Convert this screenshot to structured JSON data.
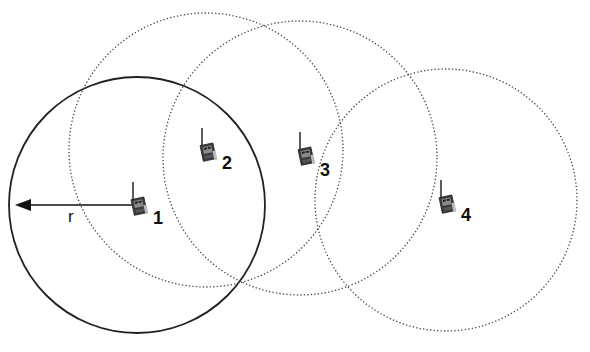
{
  "diagram": {
    "type": "wireless-network-range",
    "radius_label": "r",
    "colors": {
      "stroke": "#222222",
      "node_body": "#3a3a3a",
      "node_screen": "#8a8a8a",
      "background": "#ffffff"
    },
    "nodes": [
      {
        "id": "1",
        "label": "1",
        "cx": 137,
        "cy": 205,
        "range_radius": 128,
        "range_style": "solid",
        "icon": "radio-transceiver-icon"
      },
      {
        "id": "2",
        "label": "2",
        "cx": 206,
        "cy": 150,
        "range_radius": 137,
        "range_style": "dotted",
        "icon": "radio-transceiver-icon"
      },
      {
        "id": "3",
        "label": "3",
        "cx": 300,
        "cy": 158,
        "range_radius": 137,
        "range_style": "dotted",
        "icon": "radio-transceiver-icon"
      },
      {
        "id": "4",
        "label": "4",
        "cx": 446,
        "cy": 200,
        "range_radius": 131,
        "range_style": "dotted",
        "icon": "radio-transceiver-icon"
      }
    ],
    "radius_arrow": {
      "from_node": "1",
      "x1": 132,
      "y1": 205,
      "x2": 15,
      "y2": 205
    }
  }
}
